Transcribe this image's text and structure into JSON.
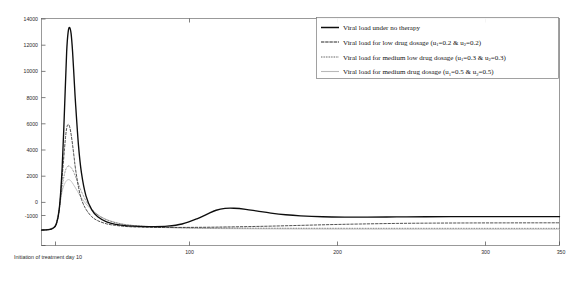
{
  "chart_data": {
    "type": "line",
    "title": "",
    "xlabel": "",
    "ylabel": "",
    "xlim": [
      0,
      350
    ],
    "ylim": [
      -1000,
      14000
    ],
    "grid": false,
    "legend_position": "top-right",
    "x_ticks": [
      100,
      200,
      300,
      350
    ],
    "x_tick_labels": [
      "100",
      "200",
      "300",
      "350"
    ],
    "y_ticks": [
      -1000,
      0,
      2000,
      4000,
      6000,
      8000,
      10000,
      12000,
      14000
    ],
    "y_tick_labels": [
      "-1000",
      "0",
      "2000",
      "4000",
      "6000",
      "8000",
      "10000",
      "12000",
      "14000"
    ],
    "annotations": [
      {
        "text": "Initiation of treatment day 10",
        "x": 0,
        "y": -1000,
        "placement": "below-axis-left"
      }
    ],
    "series": [
      {
        "name": "no_therapy",
        "legend": "Viral load under no therapy",
        "style": "solid-thick",
        "color": "#0d0d0d",
        "x": [
          0,
          3,
          6,
          8,
          10,
          12,
          14,
          16,
          17,
          18,
          19,
          20,
          21,
          22,
          23,
          25,
          27,
          30,
          34,
          38,
          44,
          50,
          58,
          66,
          75,
          85,
          95,
          105,
          112,
          118,
          124,
          130,
          138,
          146,
          155,
          165,
          175,
          190,
          205,
          220,
          240,
          260,
          285,
          310,
          330,
          350
        ],
        "y": [
          20,
          30,
          70,
          160,
          420,
          1400,
          4200,
          9200,
          11800,
          13100,
          13400,
          13000,
          11800,
          10100,
          8400,
          5600,
          3800,
          2300,
          1350,
          900,
          560,
          400,
          300,
          260,
          250,
          280,
          420,
          760,
          1080,
          1330,
          1450,
          1460,
          1390,
          1270,
          1140,
          1030,
          960,
          900,
          880,
          880,
          890,
          900,
          905,
          905,
          905,
          905
        ]
      },
      {
        "name": "low_dosage",
        "legend": "Viral load for low drug dosage (u₁=0.2 & u₂=0.2)",
        "u1": 0.2,
        "u2": 0.2,
        "style": "dashed",
        "color": "#262626",
        "x": [
          0,
          3,
          6,
          8,
          10,
          12,
          14,
          16,
          17,
          18,
          19,
          20,
          21,
          22,
          23,
          25,
          27,
          30,
          34,
          38,
          44,
          50,
          58,
          66,
          75,
          85,
          95,
          105,
          115,
          125,
          140,
          155,
          175,
          195,
          215,
          240,
          265,
          290,
          315,
          335,
          350
        ],
        "y": [
          20,
          30,
          70,
          160,
          420,
          1400,
          3600,
          5900,
          6750,
          7000,
          6850,
          6350,
          5650,
          4850,
          4050,
          2850,
          2050,
          1400,
          900,
          640,
          430,
          330,
          250,
          215,
          200,
          195,
          195,
          200,
          210,
          225,
          250,
          280,
          330,
          380,
          420,
          460,
          480,
          490,
          495,
          498,
          500
        ]
      },
      {
        "name": "medium_low_dosage",
        "legend": "Viral load for medium low drug dosage (u₁=0.3 & u₂=0.3)",
        "u1": 0.3,
        "u2": 0.3,
        "style": "dotted",
        "color": "#3d3d3d",
        "x": [
          0,
          3,
          6,
          8,
          10,
          12,
          14,
          16,
          18,
          20,
          21,
          22,
          24,
          26,
          28,
          31,
          35,
          40,
          46,
          54,
          62,
          72,
          84,
          96,
          110,
          125,
          145,
          165,
          190,
          215,
          245,
          275,
          305,
          330,
          350
        ],
        "y": [
          20,
          30,
          70,
          160,
          420,
          1350,
          2900,
          3900,
          4250,
          4150,
          4000,
          3800,
          3300,
          2800,
          2350,
          1800,
          1300,
          900,
          620,
          420,
          320,
          250,
          200,
          175,
          160,
          152,
          145,
          140,
          138,
          136,
          135,
          134,
          133,
          132,
          132
        ]
      },
      {
        "name": "medium_dosage",
        "legend": "Viral load for medium drug dosage (u₁=0.5 & u₂=0.5)",
        "u1": 0.5,
        "u2": 0.5,
        "style": "solid-light",
        "color": "#b9b9b9",
        "x": [
          0,
          4,
          8,
          10,
          12,
          14,
          16,
          18,
          20,
          23,
          26,
          30,
          35,
          40,
          46,
          54,
          62,
          72,
          84,
          96,
          112,
          130,
          150,
          175,
          205,
          240,
          275,
          310,
          340,
          350
        ],
        "y": [
          20,
          60,
          200,
          520,
          1500,
          2600,
          3150,
          3350,
          3250,
          2800,
          2300,
          1750,
          1250,
          900,
          640,
          430,
          320,
          235,
          180,
          150,
          125,
          110,
          100,
          92,
          86,
          82,
          80,
          78,
          77,
          77
        ]
      }
    ]
  },
  "legend": {
    "items": [
      {
        "key": "k-none",
        "label": "Viral load under no therapy",
        "sub": []
      },
      {
        "key": "k-low",
        "label_pre": "Viral load for low drug dosage (u",
        "s1": "1",
        "mid": "=0.2 & u",
        "s2": "2",
        "post": "=0.2)"
      },
      {
        "key": "k-medlow",
        "label_pre": "Viral load for medium low drug dosage (u",
        "s1": "1",
        "mid": "=0.3 & u",
        "s2": "2",
        "post": "=0.3)"
      },
      {
        "key": "k-med",
        "label_pre": "Viral load for medium drug dosage (u",
        "s1": "1",
        "mid": "=0.5 & u",
        "s2": "2",
        "post": "=0.5)"
      }
    ]
  },
  "axis": {
    "note": "Initiation of treatment day 10",
    "x_labels": [
      "100",
      "200",
      "300",
      "350"
    ],
    "y_labels": [
      "14000",
      "12000",
      "10000",
      "8000",
      "6000",
      "4000",
      "2000",
      "0",
      "-1000"
    ]
  }
}
